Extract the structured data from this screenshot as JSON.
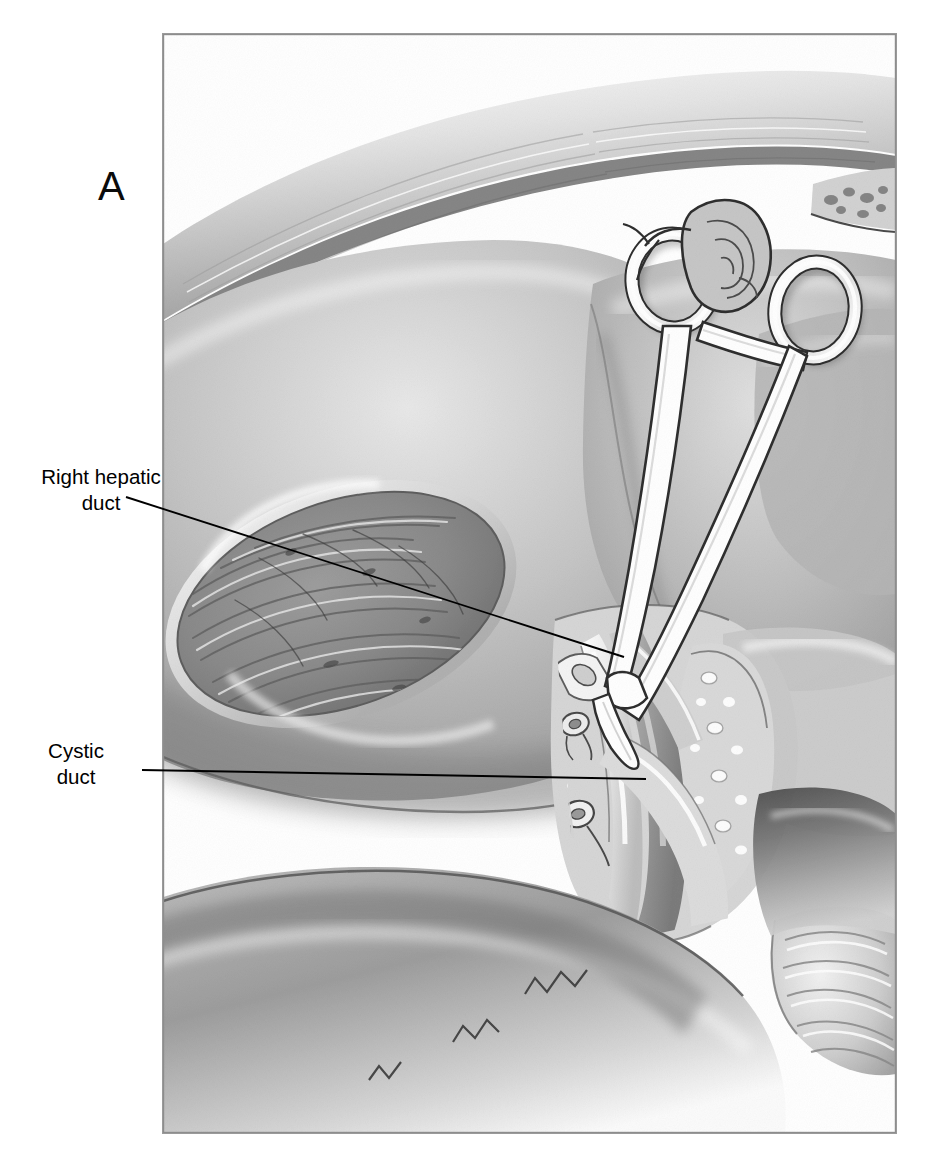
{
  "figure": {
    "panel_letter": "A",
    "domain_note": "surgical anatomical illustration",
    "frame": {
      "x": 163,
      "y": 34,
      "width": 733,
      "height": 1099
    },
    "background_color": "#ffffff",
    "ink_color": "#000000"
  },
  "labels": [
    {
      "id": "right-hepatic-duct",
      "text": "Right hepatic\nduct",
      "line1": "Right hepatic",
      "line2": "duct",
      "x": 31,
      "y": 464,
      "leader": {
        "x1": 126,
        "y1": 497,
        "x2": 624,
        "y2": 657
      }
    },
    {
      "id": "cystic-duct",
      "text": "Cystic\nduct",
      "line1": "Cystic",
      "line2": "duct",
      "x": 10,
      "y": 738,
      "leader": {
        "x1": 142,
        "y1": 770,
        "x2": 646,
        "y2": 779
      }
    }
  ],
  "illustration": {
    "title": "Porta hepatis dissection after cholecystectomy",
    "structures": [
      {
        "name": "liver-right-lobe",
        "tone": "#b4b4b4"
      },
      {
        "name": "gallbladder-fossa",
        "tone": "#8e8e8e"
      },
      {
        "name": "liver-quadrate-lobe",
        "tone": "#c2c2c2"
      },
      {
        "name": "diaphragm-fibrous-band",
        "tone": "#d7d7d7"
      },
      {
        "name": "hemostat-clamp",
        "tone": "#ffffff"
      },
      {
        "name": "right-hepatic-duct-stump",
        "tone": "#efefef"
      },
      {
        "name": "cystic-duct-stump",
        "tone": "#efefef"
      },
      {
        "name": "common-bile-duct",
        "tone": "#e6e6e6"
      },
      {
        "name": "hepatic-artery",
        "tone": "#dcdcdc"
      },
      {
        "name": "portal-vein",
        "tone": "#9c9c9c"
      },
      {
        "name": "hepatoduodenal-ligament",
        "tone": "#cdcdcd"
      },
      {
        "name": "duodenum",
        "tone": "#a0a0a0"
      },
      {
        "name": "stomach-antrum",
        "tone": "#909090"
      },
      {
        "name": "pancreas-head",
        "tone": "#c6c6c6"
      }
    ],
    "instrument": {
      "name": "hemostat-clamp",
      "ring_left": {
        "cx": 672,
        "cy": 281,
        "rx": 36,
        "ry": 42
      },
      "ring_right": {
        "cx": 816,
        "cy": 310,
        "rx": 35,
        "ry": 43
      },
      "tip": {
        "x": 627,
        "y": 660
      }
    }
  }
}
